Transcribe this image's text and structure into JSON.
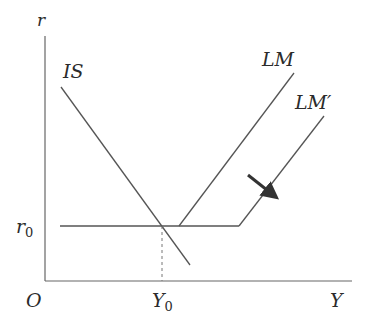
{
  "diagram": {
    "type": "IS-LM model with liquidity trap segment",
    "axes": {
      "y_label": "r",
      "x_label": "Y",
      "origin_label": "O"
    },
    "curves": [
      {
        "name": "IS",
        "label": "IS"
      },
      {
        "name": "LM",
        "label": "LM"
      },
      {
        "name": "LM'",
        "label": "LM′"
      }
    ],
    "markers": {
      "r0_label": "r",
      "r0_sub": "0",
      "Y0_label": "Y",
      "Y0_sub": "0"
    },
    "annotations": {
      "shift_arrow": "arrow indicating rightward shift from LM to LM′"
    },
    "colors": {
      "line": "#555555",
      "text": "#2b2b2b",
      "arrow": "#333333",
      "background": "#ffffff"
    }
  }
}
